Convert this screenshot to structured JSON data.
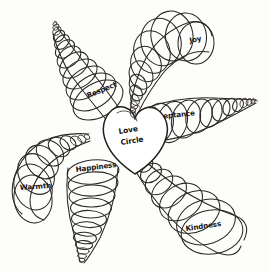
{
  "artwork": {
    "title": "Love Circle spiral diagram",
    "medium": "pen sketch",
    "ink_color": "#2a2724",
    "paper_color": "#fdfdfc"
  },
  "center": {
    "shape": "heart",
    "label_line1": "Love",
    "label_line2": "Circle"
  },
  "branches": [
    {
      "id": "respect",
      "label": "Respect",
      "direction": "upper-left",
      "taper": "large-at-center-to-small-at-tip",
      "label_x": 88,
      "label_y": 98,
      "label_rotate": -22
    },
    {
      "id": "joy",
      "label": "Joy",
      "direction": "upper-right",
      "taper": "small-at-center-to-large-at-tip",
      "label_x": 190,
      "label_y": 43,
      "label_rotate": -12
    },
    {
      "id": "acceptance",
      "label": "Acceptance",
      "direction": "right",
      "taper": "large-at-center-to-small-at-tip",
      "label_x": 150,
      "label_y": 120,
      "label_rotate": -6
    },
    {
      "id": "kindness",
      "label": "Kindness",
      "direction": "lower-right",
      "taper": "small-at-center-to-large-at-tip",
      "label_x": 186,
      "label_y": 231,
      "label_rotate": -8
    },
    {
      "id": "happiness",
      "label": "Happiness",
      "direction": "down",
      "taper": "large-at-center-to-small-at-tip",
      "label_x": 76,
      "label_y": 172,
      "label_rotate": -7
    },
    {
      "id": "warmth",
      "label": "Warmth",
      "direction": "lower-left",
      "taper": "small-at-center-to-large-at-tip",
      "label_x": 20,
      "label_y": 190,
      "label_rotate": -4
    }
  ]
}
